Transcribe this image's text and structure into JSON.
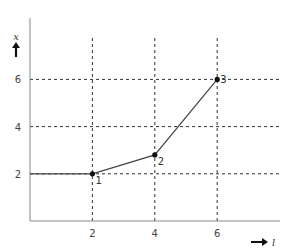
{
  "chart_data": {
    "type": "line",
    "title": "",
    "xlabel": "l",
    "ylabel": "x",
    "xlim": [
      0,
      8.1
    ],
    "ylim": [
      0,
      8.5
    ],
    "x_ticks": [
      2,
      4,
      6
    ],
    "y_ticks": [
      2,
      4,
      6
    ],
    "grid": true,
    "grid_style": "dashed",
    "series": [
      {
        "name": "x(l)",
        "x": [
          0,
          2,
          4,
          6
        ],
        "y": [
          2,
          2,
          2.8,
          6
        ],
        "color": "#444444"
      }
    ],
    "points": [
      {
        "label": "1",
        "x": 2,
        "y": 2
      },
      {
        "label": "2",
        "x": 4,
        "y": 2.8
      },
      {
        "label": "3",
        "x": 6,
        "y": 6
      }
    ]
  }
}
